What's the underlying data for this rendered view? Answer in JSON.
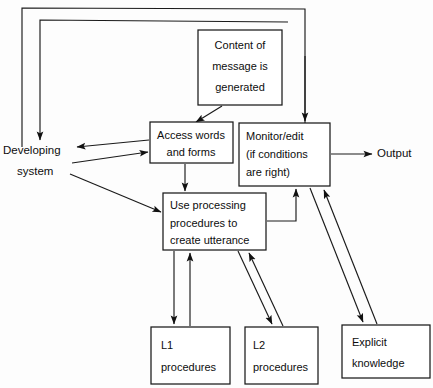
{
  "diagram": {
    "nodes": [
      {
        "id": "content",
        "name": "content-of-message-box",
        "lines": [
          "Content of",
          "message is",
          "generated"
        ],
        "x": 198,
        "y": 30,
        "w": 84,
        "h": 75,
        "boxed": true
      },
      {
        "id": "developing",
        "name": "developing-system-label",
        "lines": [
          "Developing",
          "system"
        ],
        "x": 2,
        "y": 140,
        "w": 70,
        "h": 36,
        "boxed": false
      },
      {
        "id": "access",
        "name": "access-words-and-forms-box",
        "lines": [
          "Access words",
          "and forms"
        ],
        "x": 150,
        "y": 122,
        "w": 83,
        "h": 41,
        "boxed": true
      },
      {
        "id": "monitor",
        "name": "monitor-edit-box",
        "lines": [
          "Monitor/edit",
          "(if conditions",
          "are right)"
        ],
        "x": 239,
        "y": 123,
        "w": 91,
        "h": 63,
        "boxed": true
      },
      {
        "id": "output",
        "name": "output-label",
        "lines": [
          "Output"
        ],
        "x": 376,
        "y": 146,
        "w": 46,
        "h": 16,
        "boxed": false
      },
      {
        "id": "useproc",
        "name": "use-processing-procedures-box",
        "lines": [
          "Use processing",
          "procedures to",
          "create utterance"
        ],
        "x": 163,
        "y": 193,
        "w": 103,
        "h": 57,
        "boxed": true
      },
      {
        "id": "l1",
        "name": "l1-procedures-box",
        "lines": [
          "L1",
          "procedures"
        ],
        "x": 151,
        "y": 327,
        "w": 79,
        "h": 57,
        "boxed": true
      },
      {
        "id": "l2",
        "name": "l2-procedures-box",
        "lines": [
          "L2",
          "procedures"
        ],
        "x": 245,
        "y": 327,
        "w": 73,
        "h": 57,
        "boxed": true
      },
      {
        "id": "explicit",
        "name": "explicit-knowledge-box",
        "lines": [
          "Explicit",
          "knowledge"
        ],
        "x": 342,
        "y": 325,
        "w": 88,
        "h": 53,
        "boxed": true
      }
    ],
    "edges": [
      {
        "name": "edge-monitor-feedback-outer-to-developing",
        "from": "monitor",
        "to": "developing",
        "label": ""
      },
      {
        "name": "edge-monitor-feedback-inner-to-developing",
        "from": "monitor",
        "to": "developing",
        "label": ""
      },
      {
        "name": "edge-content-to-access",
        "from": "content",
        "to": "access",
        "label": ""
      },
      {
        "name": "edge-content-to-monitor",
        "from": "content",
        "to": "monitor",
        "label": ""
      },
      {
        "name": "edge-access-to-developing",
        "from": "access",
        "to": "developing",
        "label": ""
      },
      {
        "name": "edge-developing-to-access",
        "from": "developing",
        "to": "access",
        "label": ""
      },
      {
        "name": "edge-developing-to-useproc",
        "from": "developing",
        "to": "useproc",
        "label": ""
      },
      {
        "name": "edge-access-to-useproc",
        "from": "access",
        "to": "useproc",
        "label": ""
      },
      {
        "name": "edge-monitor-to-output",
        "from": "monitor",
        "to": "output",
        "label": ""
      },
      {
        "name": "edge-useproc-to-monitor",
        "from": "useproc",
        "to": "monitor",
        "label": ""
      },
      {
        "name": "edge-useproc-to-l1",
        "from": "useproc",
        "to": "l1",
        "label": ""
      },
      {
        "name": "edge-l1-to-useproc",
        "from": "l1",
        "to": "useproc",
        "label": ""
      },
      {
        "name": "edge-useproc-to-l2",
        "from": "useproc",
        "to": "l2",
        "label": ""
      },
      {
        "name": "edge-l2-to-useproc",
        "from": "l2",
        "to": "useproc",
        "label": ""
      },
      {
        "name": "edge-monitor-to-explicit",
        "from": "monitor",
        "to": "explicit",
        "label": ""
      },
      {
        "name": "edge-explicit-to-monitor",
        "from": "explicit",
        "to": "monitor",
        "label": ""
      }
    ]
  }
}
